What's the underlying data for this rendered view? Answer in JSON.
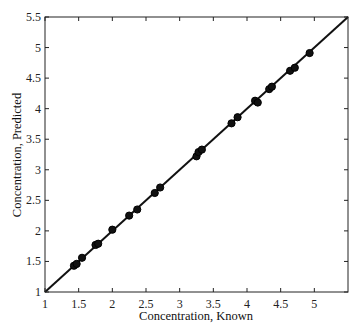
{
  "chart_data": {
    "type": "scatter",
    "title": "",
    "xlabel": "Concentration, Known",
    "ylabel": "Concentration, Predicted",
    "xlim": [
      1,
      5.5
    ],
    "ylim": [
      1,
      5.5
    ],
    "xticks": [
      1,
      1.5,
      2,
      2.5,
      3,
      3.5,
      4,
      4.5,
      5
    ],
    "xtick_labels": [
      "1",
      "1.5",
      "2",
      "2.5",
      "3",
      "3.5",
      "4",
      "4.5",
      "5"
    ],
    "yticks": [
      1,
      1.5,
      2,
      2.5,
      3,
      3.5,
      4,
      4.5,
      5,
      5.5
    ],
    "ytick_labels": [
      "1",
      "1.5",
      "2",
      "2.5",
      "3",
      "3.5",
      "4",
      "4.5",
      "5",
      "5.5"
    ],
    "grid": false,
    "legend": null,
    "reference_line": {
      "x": [
        1,
        5.5
      ],
      "y": [
        1,
        5.5
      ],
      "label": "y = x"
    },
    "series": [
      {
        "name": "samples",
        "x": [
          1.43,
          1.47,
          1.55,
          1.75,
          1.79,
          2.0,
          2.25,
          2.37,
          2.63,
          2.71,
          3.25,
          3.28,
          3.33,
          3.77,
          3.86,
          4.12,
          4.16,
          4.33,
          4.37,
          4.64,
          4.71,
          4.93
        ],
        "y": [
          1.43,
          1.46,
          1.56,
          1.77,
          1.79,
          2.02,
          2.25,
          2.35,
          2.62,
          2.71,
          3.22,
          3.29,
          3.33,
          3.76,
          3.86,
          4.13,
          4.1,
          4.32,
          4.36,
          4.62,
          4.67,
          4.91
        ]
      }
    ]
  },
  "colors": {
    "line": "#111111",
    "marker": "#111111",
    "axes": "#222222"
  }
}
